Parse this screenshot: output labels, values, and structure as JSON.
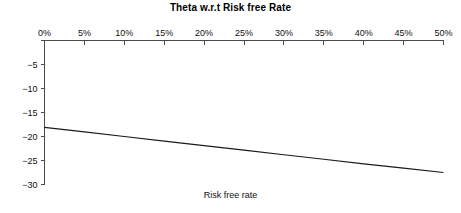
{
  "chart_data": {
    "type": "line",
    "title": "Theta w.r.t Risk free Rate",
    "xlabel": "Risk free rate",
    "ylabel": "",
    "x": [
      0,
      5,
      10,
      15,
      20,
      25,
      30,
      35,
      40,
      45,
      50
    ],
    "xtick_labels": [
      "0%",
      "5%",
      "10%",
      "15%",
      "20%",
      "25%",
      "30%",
      "35%",
      "40%",
      "45%",
      "50%"
    ],
    "ytick_labels": [
      "",
      "−5",
      "−10",
      "−15",
      "−20",
      "−25",
      "−30"
    ],
    "ytick_values": [
      0,
      -5,
      -10,
      -15,
      -20,
      -25,
      -30
    ],
    "series": [
      {
        "name": "Theta",
        "values": [
          -18.1,
          -19.05,
          -20.0,
          -20.95,
          -21.9,
          -22.85,
          -23.8,
          -24.75,
          -25.7,
          -26.6,
          -27.5
        ]
      }
    ],
    "xlim": [
      0,
      50
    ],
    "ylim": [
      -30,
      0
    ],
    "grid": false,
    "legend": false,
    "line_color": "#1a1a1a",
    "axis_color": "#4a4a4a",
    "background": "#ffffff"
  }
}
